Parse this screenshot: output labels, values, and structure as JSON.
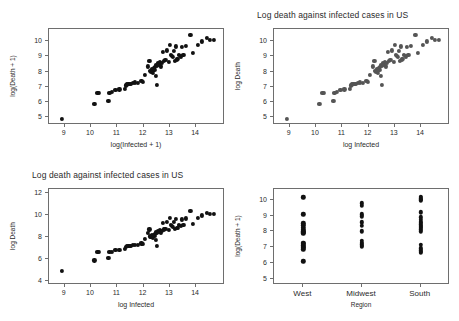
{
  "figure": {
    "background": "#ffffff",
    "point_color_dark": "#111111",
    "point_color_gray": "#555555",
    "frame_color": "#6e6e6e"
  },
  "chart_data": [
    {
      "id": "panel-top-left",
      "type": "scatter",
      "title": "",
      "xlabel": "log(Infected + 1)",
      "ylabel": "log(Death + 1)",
      "xlim": [
        8.4,
        15.1
      ],
      "ylim": [
        4.5,
        10.8
      ],
      "xticks": [
        9,
        10,
        11,
        12,
        13,
        14
      ],
      "yticks": [
        5,
        6,
        7,
        8,
        9,
        10
      ],
      "grid": false,
      "legend": "none",
      "marker_color": "#111111",
      "x": [
        8.9,
        10.13,
        10.24,
        10.29,
        10.66,
        10.7,
        10.79,
        10.93,
        11.08,
        11.28,
        11.33,
        11.38,
        11.42,
        11.47,
        11.52,
        11.58,
        11.66,
        11.79,
        11.92,
        11.97,
        12.05,
        12.16,
        12.22,
        12.26,
        12.3,
        12.33,
        12.36,
        12.38,
        12.41,
        12.43,
        12.46,
        12.48,
        12.5,
        12.52,
        12.55,
        12.58,
        12.62,
        12.66,
        12.7,
        12.74,
        12.78,
        12.83,
        12.88,
        12.95,
        13.0,
        13.04,
        13.08,
        13.12,
        13.16,
        13.2,
        13.24,
        13.28,
        13.32,
        13.36,
        13.41,
        13.46,
        13.52,
        13.6,
        13.78,
        13.88,
        14.06,
        14.22,
        14.41,
        14.54,
        14.68
      ],
      "y": [
        4.88,
        5.86,
        6.63,
        6.62,
        6.07,
        6.63,
        6.66,
        6.8,
        6.84,
        6.88,
        7.1,
        7.16,
        7.19,
        7.22,
        7.18,
        7.26,
        7.3,
        7.28,
        7.42,
        7.35,
        7.81,
        8.35,
        8.69,
        8.05,
        8.0,
        8.15,
        7.9,
        8.22,
        8.1,
        8.3,
        8.42,
        7.7,
        7.15,
        8.4,
        8.55,
        8.48,
        8.62,
        8.35,
        8.58,
        9.3,
        8.7,
        8.75,
        9.4,
        8.62,
        9.78,
        9.1,
        9.02,
        8.95,
        9.38,
        8.72,
        9.66,
        8.8,
        8.85,
        9.08,
        9.0,
        9.62,
        9.1,
        9.7,
        10.42,
        9.22,
        9.75,
        9.98,
        10.2,
        10.08,
        10.1
      ]
    },
    {
      "id": "panel-top-right",
      "type": "scatter",
      "title": "Log death against infected cases in US",
      "xlabel": "log Infected",
      "ylabel": "log Death",
      "xlim": [
        8.4,
        15.1
      ],
      "ylim": [
        4.5,
        10.8
      ],
      "xticks": [
        9,
        10,
        11,
        12,
        13,
        14
      ],
      "yticks": [
        5,
        6,
        7,
        8,
        9,
        10
      ],
      "grid": false,
      "legend": "none",
      "marker_color": "#555555",
      "x": [
        8.9,
        10.13,
        10.24,
        10.29,
        10.66,
        10.7,
        10.79,
        10.93,
        11.08,
        11.28,
        11.33,
        11.38,
        11.42,
        11.47,
        11.52,
        11.58,
        11.66,
        11.79,
        11.92,
        11.97,
        12.05,
        12.16,
        12.22,
        12.26,
        12.3,
        12.33,
        12.36,
        12.38,
        12.41,
        12.43,
        12.46,
        12.48,
        12.5,
        12.52,
        12.55,
        12.58,
        12.62,
        12.66,
        12.7,
        12.74,
        12.78,
        12.83,
        12.88,
        12.95,
        13.0,
        13.04,
        13.08,
        13.12,
        13.16,
        13.2,
        13.24,
        13.28,
        13.32,
        13.36,
        13.41,
        13.46,
        13.52,
        13.6,
        13.78,
        13.88,
        14.06,
        14.22,
        14.41,
        14.54,
        14.68
      ],
      "y": [
        4.88,
        5.86,
        6.63,
        6.62,
        6.07,
        6.63,
        6.66,
        6.8,
        6.84,
        6.88,
        7.1,
        7.16,
        7.19,
        7.22,
        7.18,
        7.26,
        7.3,
        7.28,
        7.42,
        7.35,
        7.81,
        8.35,
        8.69,
        8.05,
        8.0,
        8.15,
        7.9,
        8.22,
        8.1,
        8.3,
        8.42,
        7.7,
        7.15,
        8.4,
        8.55,
        8.48,
        8.62,
        8.35,
        8.58,
        9.3,
        8.7,
        8.75,
        9.4,
        8.62,
        9.78,
        9.1,
        9.02,
        8.95,
        9.38,
        8.72,
        9.66,
        8.8,
        8.85,
        9.08,
        9.0,
        9.62,
        9.1,
        9.7,
        10.42,
        9.22,
        9.75,
        9.98,
        10.2,
        10.08,
        10.1
      ]
    },
    {
      "id": "panel-bottom-left",
      "type": "scatter",
      "title": "Log death against infected cases in US",
      "xlabel": "log Infected",
      "ylabel": "log Death",
      "xlim": [
        8.4,
        15.1
      ],
      "ylim": [
        3.6,
        12.4
      ],
      "xticks": [
        9,
        10,
        11,
        12,
        13,
        14
      ],
      "yticks": [
        4,
        6,
        8,
        10,
        12
      ],
      "grid": false,
      "legend": "none",
      "marker_color": "#111111",
      "x": [
        8.9,
        10.13,
        10.24,
        10.29,
        10.66,
        10.7,
        10.79,
        10.93,
        11.08,
        11.28,
        11.33,
        11.38,
        11.42,
        11.47,
        11.52,
        11.58,
        11.66,
        11.79,
        11.92,
        11.97,
        12.05,
        12.16,
        12.22,
        12.26,
        12.3,
        12.33,
        12.36,
        12.38,
        12.41,
        12.43,
        12.46,
        12.48,
        12.5,
        12.52,
        12.55,
        12.58,
        12.62,
        12.66,
        12.7,
        12.74,
        12.78,
        12.83,
        12.88,
        12.95,
        13.0,
        13.04,
        13.08,
        13.12,
        13.16,
        13.2,
        13.24,
        13.28,
        13.32,
        13.36,
        13.41,
        13.46,
        13.52,
        13.6,
        13.78,
        13.88,
        14.06,
        14.22,
        14.41,
        14.54,
        14.68
      ],
      "y": [
        4.88,
        5.86,
        6.63,
        6.62,
        6.07,
        6.63,
        6.66,
        6.8,
        6.84,
        6.88,
        7.1,
        7.16,
        7.19,
        7.22,
        7.18,
        7.26,
        7.3,
        7.28,
        7.42,
        7.35,
        7.81,
        8.35,
        8.69,
        8.05,
        8.0,
        8.15,
        7.9,
        8.22,
        8.1,
        8.3,
        8.42,
        7.7,
        7.15,
        8.4,
        8.55,
        8.48,
        8.62,
        8.35,
        8.58,
        9.3,
        8.7,
        8.75,
        9.4,
        8.62,
        9.78,
        9.1,
        9.02,
        8.95,
        9.38,
        8.72,
        9.66,
        8.8,
        8.85,
        9.08,
        9.0,
        9.62,
        9.1,
        9.7,
        10.42,
        9.22,
        9.75,
        9.98,
        10.2,
        10.08,
        10.1
      ]
    },
    {
      "id": "panel-bottom-right",
      "type": "scatter",
      "title": "",
      "xlabel": "Region",
      "ylabel": "log(Death + 1)",
      "ylim": [
        4.6,
        10.7
      ],
      "yticks": [
        5,
        6,
        7,
        8,
        9,
        10
      ],
      "categories": [
        "West",
        "Midwest",
        "South"
      ],
      "grid": false,
      "legend": "none",
      "marker_color": "#111111",
      "series": [
        {
          "name": "West",
          "values": [
            10.18,
            9.1,
            8.52,
            8.4,
            8.22,
            8.1,
            8.02,
            7.95,
            7.88,
            7.3,
            7.2,
            7.12,
            7.04,
            6.95,
            6.88,
            6.1
          ]
        },
        {
          "name": "Midwest",
          "values": [
            9.8,
            9.62,
            9.1,
            8.96,
            8.58,
            8.38,
            8.02,
            7.4,
            7.28,
            7.18,
            7.1,
            7.04
          ]
        },
        {
          "name": "South",
          "values": [
            10.2,
            10.12,
            10.02,
            9.98,
            9.22,
            8.9,
            8.76,
            8.62,
            8.54,
            8.46,
            8.38,
            8.3,
            8.22,
            8.14,
            8.02,
            7.16,
            6.92,
            6.8,
            6.72,
            6.66
          ]
        }
      ]
    }
  ]
}
